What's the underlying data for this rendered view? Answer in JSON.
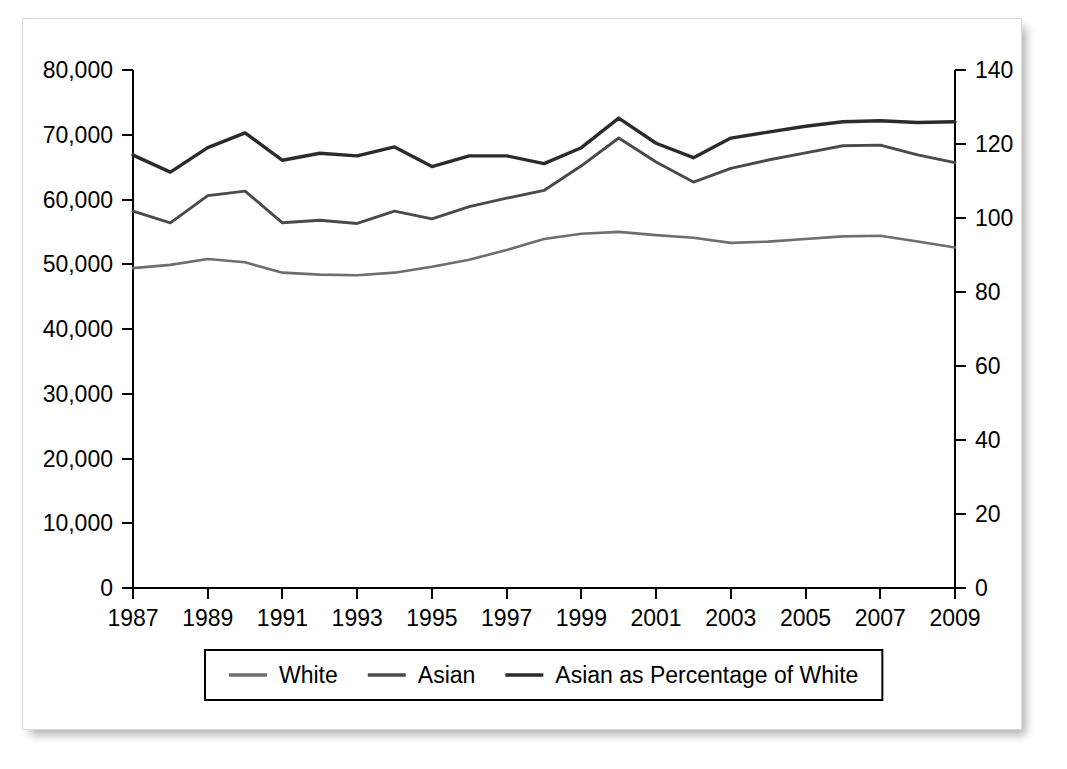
{
  "figure": {
    "frame_present": true,
    "background_color": "#ffffff",
    "border_color": "#d8d8d8"
  },
  "chart_data": {
    "type": "line",
    "title": "",
    "subtitle": "",
    "xlabel": "",
    "ylabel": "",
    "y2label": "",
    "grid": false,
    "legend_position": "bottom",
    "x": [
      1987,
      1988,
      1989,
      1990,
      1991,
      1992,
      1993,
      1994,
      1995,
      1996,
      1997,
      1998,
      1999,
      2000,
      2001,
      2002,
      2003,
      2004,
      2005,
      2006,
      2007,
      2008,
      2009
    ],
    "x_tick_labels": [
      "1987",
      "1989",
      "1991",
      "1993",
      "1995",
      "1997",
      "1999",
      "2001",
      "2003",
      "2005",
      "2007",
      "2009"
    ],
    "x_tick_values": [
      1987,
      1989,
      1991,
      1993,
      1995,
      1997,
      1999,
      2001,
      2003,
      2005,
      2007,
      2009
    ],
    "xlim": [
      1987,
      2009
    ],
    "ylim": [
      0,
      80000
    ],
    "y_tick_labels": [
      "0",
      "10,000",
      "20,000",
      "30,000",
      "40,000",
      "50,000",
      "60,000",
      "70,000",
      "80,000"
    ],
    "y_tick_values": [
      0,
      10000,
      20000,
      30000,
      40000,
      50000,
      60000,
      70000,
      80000
    ],
    "y2lim": [
      0,
      140
    ],
    "y2_tick_labels": [
      "0",
      "20",
      "40",
      "60",
      "80",
      "100",
      "120",
      "140"
    ],
    "y2_tick_values": [
      0,
      20,
      40,
      60,
      80,
      100,
      120,
      140
    ],
    "series": [
      {
        "name": "White",
        "axis": "left",
        "color": "#6e6e6e",
        "width": 2.6,
        "values": [
          49400,
          49900,
          50800,
          50300,
          48700,
          48400,
          48300,
          48700,
          49600,
          50700,
          52200,
          53900,
          54700,
          55000,
          54500,
          54100,
          53300,
          53500,
          53900,
          54300,
          54400,
          53500,
          52600
        ]
      },
      {
        "name": "Asian",
        "axis": "left",
        "color": "#4a4a4a",
        "width": 2.9,
        "values": [
          58200,
          56400,
          60600,
          61300,
          56400,
          56800,
          56300,
          58200,
          57000,
          58900,
          60200,
          61400,
          65200,
          69500,
          65800,
          62700,
          64800,
          66100,
          67200,
          68300,
          68400,
          66900,
          65700
        ]
      },
      {
        "name": "Asian as Percentage of White",
        "axis": "right",
        "color": "#2b2b2b",
        "width": 3.4,
        "values": [
          117.0,
          112.4,
          119.0,
          123.0,
          115.6,
          117.5,
          116.8,
          119.2,
          113.9,
          116.8,
          116.8,
          114.7,
          119.0,
          127.0,
          120.2,
          116.3,
          121.6,
          123.2,
          124.8,
          126.0,
          126.3,
          125.8,
          126.0
        ]
      }
    ],
    "legend": [
      {
        "label": "White",
        "color": "#6e6e6e"
      },
      {
        "label": "Asian",
        "color": "#4a4a4a"
      },
      {
        "label": "Asian as Percentage of White",
        "color": "#2b2b2b"
      }
    ]
  }
}
